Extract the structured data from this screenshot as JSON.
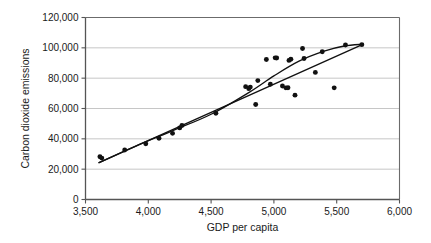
{
  "chart_data": {
    "type": "scatter",
    "title": "",
    "xlabel": "GDP per capita",
    "ylabel": "Carbon dioxide emissions",
    "xlim": [
      3500,
      6000
    ],
    "ylim": [
      0,
      120000
    ],
    "xticks": [
      3500,
      4000,
      4500,
      5000,
      5500,
      6000
    ],
    "xtick_labels": [
      "3,500",
      "4,000",
      "4,500",
      "5,000",
      "5,500",
      "6,000"
    ],
    "yticks": [
      0,
      20000,
      40000,
      60000,
      80000,
      100000,
      120000
    ],
    "ytick_labels": [
      "0",
      "20,000",
      "40,000",
      "60,000",
      "80,000",
      "100,000",
      "120,000"
    ],
    "grid": "horizontal",
    "legend": "none",
    "marker_color": "#111111",
    "line_color": "#111111",
    "grid_color": "#b8b8b8",
    "axis_color": "#6b6b6b",
    "points": [
      {
        "x": 3615,
        "y": 28200
      },
      {
        "x": 3630,
        "y": 27300
      },
      {
        "x": 3812,
        "y": 32600
      },
      {
        "x": 3980,
        "y": 36700
      },
      {
        "x": 4085,
        "y": 40400
      },
      {
        "x": 4193,
        "y": 43600
      },
      {
        "x": 4250,
        "y": 47200
      },
      {
        "x": 4268,
        "y": 48800
      },
      {
        "x": 4538,
        "y": 56900
      },
      {
        "x": 4775,
        "y": 74400
      },
      {
        "x": 4800,
        "y": 73100
      },
      {
        "x": 4812,
        "y": 74100
      },
      {
        "x": 4855,
        "y": 62600
      },
      {
        "x": 4872,
        "y": 78400
      },
      {
        "x": 4940,
        "y": 92300
      },
      {
        "x": 4972,
        "y": 76000
      },
      {
        "x": 5010,
        "y": 93400
      },
      {
        "x": 5022,
        "y": 93300
      },
      {
        "x": 5068,
        "y": 74800
      },
      {
        "x": 5095,
        "y": 73600
      },
      {
        "x": 5112,
        "y": 73700
      },
      {
        "x": 5120,
        "y": 91700
      },
      {
        "x": 5135,
        "y": 92500
      },
      {
        "x": 5168,
        "y": 68800
      },
      {
        "x": 5228,
        "y": 99600
      },
      {
        "x": 5240,
        "y": 93000
      },
      {
        "x": 5330,
        "y": 83800
      },
      {
        "x": 5385,
        "y": 97400
      },
      {
        "x": 5480,
        "y": 73600
      },
      {
        "x": 5570,
        "y": 101900
      },
      {
        "x": 5700,
        "y": 102100
      }
    ],
    "fit_lines": [
      {
        "name": "linear-regression-line",
        "style": "straight",
        "points": [
          {
            "x": 3608,
            "y": 24300
          },
          {
            "x": 5712,
            "y": 102400
          }
        ]
      },
      {
        "name": "curved-fit-line",
        "style": "curve",
        "points": [
          {
            "x": 3608,
            "y": 24300
          },
          {
            "x": 3900,
            "y": 35200
          },
          {
            "x": 4200,
            "y": 45600
          },
          {
            "x": 4500,
            "y": 56200
          },
          {
            "x": 4800,
            "y": 70500
          },
          {
            "x": 5000,
            "y": 81500
          },
          {
            "x": 5200,
            "y": 91200
          },
          {
            "x": 5400,
            "y": 97800
          },
          {
            "x": 5560,
            "y": 101200
          },
          {
            "x": 5712,
            "y": 102400
          }
        ]
      }
    ]
  }
}
